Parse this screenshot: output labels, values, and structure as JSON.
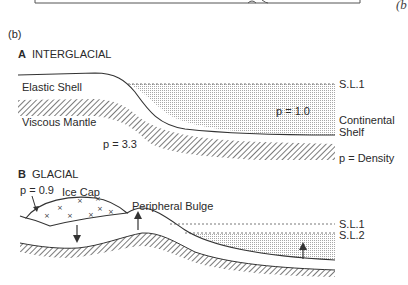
{
  "top_fragment": {
    "caption": "(b"
  },
  "figure_label": "(b)",
  "panel_a": {
    "title_letter": "A",
    "title": "INTERGLACIAL",
    "labels": {
      "elastic_shell": "Elastic Shell",
      "viscous_mantle": "Viscous Mantle",
      "mantle_density": "p = 3.3",
      "water_density": "p = 1.0",
      "sea_level": "S.L.1",
      "continental": "Continental",
      "shelf": "Shelf",
      "legend_density": "p = Density"
    }
  },
  "panel_b": {
    "title_letter": "B",
    "title": "GLACIAL",
    "labels": {
      "ice_density": "p = 0.9",
      "ice_cap": "Ice Cap",
      "peripheral_bulge": "Peripheral Bulge",
      "sea_level_1": "S.L.1",
      "sea_level_2": "S.L.2"
    },
    "ice_marker": "×"
  },
  "colors": {
    "line": "#333333",
    "stipple": "#9a9a9a",
    "hatch": "#333333"
  }
}
